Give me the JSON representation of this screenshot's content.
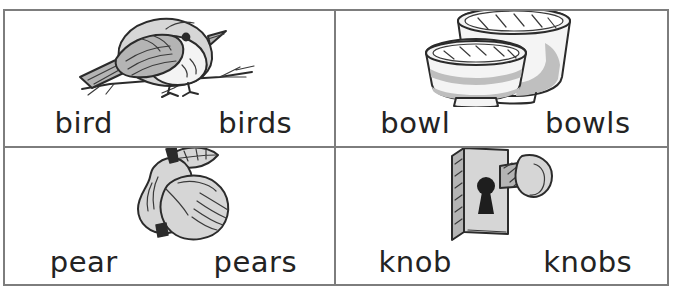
{
  "worksheet": {
    "title": "Singular and plural picture word cards",
    "border_color": "#7d7d7d",
    "text_color": "#232323",
    "background": "#ffffff",
    "columns": 2,
    "rows": 2,
    "cells": [
      {
        "id": "bird",
        "illustration": "bird-on-branch-illustration",
        "singular": "bird",
        "plural": "birds"
      },
      {
        "id": "bowl",
        "illustration": "two-bowls-illustration",
        "singular": "bowl",
        "plural": "bowls"
      },
      {
        "id": "pear",
        "illustration": "two-pears-illustration",
        "singular": "pear",
        "plural": "pears"
      },
      {
        "id": "knob",
        "illustration": "doorknob-illustration",
        "singular": "knob",
        "plural": "knobs"
      }
    ]
  }
}
